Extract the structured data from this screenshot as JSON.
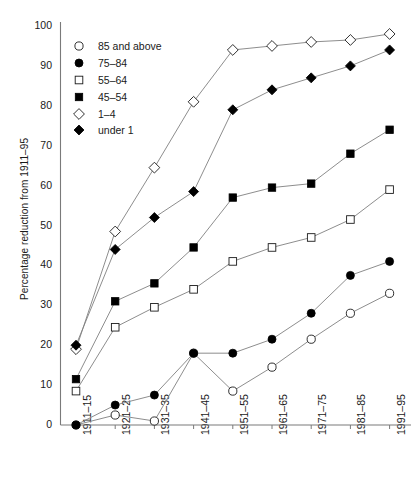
{
  "chart_data": {
    "type": "line",
    "title": "",
    "xlabel": "",
    "ylabel": "Percentage reduction from 1911–95",
    "ylim": [
      0,
      100
    ],
    "yticks": [
      0,
      10,
      20,
      30,
      40,
      50,
      60,
      70,
      80,
      90,
      100
    ],
    "grid": false,
    "legend_position": "upper-left-inside",
    "categories": [
      "1911–15",
      "1921–25",
      "1931–35",
      "1941–45",
      "1951–55",
      "1961–65",
      "1971–75",
      "1981–85",
      "1991–95"
    ],
    "series": [
      {
        "name": "85 and above",
        "marker": "open-circle",
        "values": [
          0,
          2.5,
          1,
          18,
          8.5,
          14.5,
          21.5,
          28,
          33
        ]
      },
      {
        "name": "75–84",
        "marker": "filled-circle",
        "values": [
          0,
          5,
          7.5,
          18,
          18,
          21.5,
          28,
          37.5,
          41
        ]
      },
      {
        "name": "55–64",
        "marker": "open-square",
        "values": [
          8.5,
          24.5,
          29.5,
          34,
          41,
          44.5,
          47,
          51.5,
          59
        ]
      },
      {
        "name": "45–54",
        "marker": "filled-square",
        "values": [
          11.5,
          31,
          35.5,
          44.5,
          57,
          59.5,
          60.5,
          68,
          74
        ]
      },
      {
        "name": "1–4",
        "marker": "open-diamond",
        "values": [
          19,
          48.5,
          64.5,
          81,
          94,
          95,
          96,
          96.5,
          98
        ]
      },
      {
        "name": "under 1",
        "marker": "filled-diamond",
        "values": [
          20,
          44,
          52,
          58.5,
          79,
          84,
          87,
          90,
          94
        ]
      }
    ]
  },
  "legend": {
    "items": [
      {
        "label": "85 and above",
        "marker": "open-circle"
      },
      {
        "label": "75–84",
        "marker": "filled-circle"
      },
      {
        "label": "55–64",
        "marker": "open-square"
      },
      {
        "label": "45–54",
        "marker": "filled-square"
      },
      {
        "label": "1–4",
        "marker": "open-diamond"
      },
      {
        "label": "under 1",
        "marker": "filled-diamond"
      }
    ]
  },
  "colors": {
    "line": "#808080",
    "marker_stroke": "#1a1a1a",
    "marker_fill_solid": "#000000",
    "marker_fill_open": "#ffffff",
    "axis": "#7a7a7a",
    "text": "#1a1a1a",
    "background": "#ffffff"
  }
}
